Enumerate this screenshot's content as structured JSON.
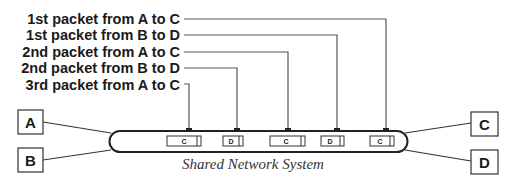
{
  "diagram": {
    "caption": "Shared Network System",
    "labels": [
      {
        "text": "1st packet from A to C",
        "y": 19,
        "x_drop": 386
      },
      {
        "text": "1st packet from B to D",
        "y": 35,
        "x_drop": 337
      },
      {
        "text": "2nd packet from A to C",
        "y": 52,
        "x_drop": 288
      },
      {
        "text": "2nd packet from B to D",
        "y": 68,
        "x_drop": 237
      },
      {
        "text": "3rd packet from A to C",
        "y": 85,
        "x_drop": 189
      }
    ],
    "nodes": {
      "a": "A",
      "b": "B",
      "c": "C",
      "d": "D"
    },
    "packets": [
      {
        "dest": "C",
        "x": 167,
        "w": 34
      },
      {
        "dest": "D",
        "x": 223,
        "w": 20
      },
      {
        "dest": "C",
        "x": 270,
        "w": 35
      },
      {
        "dest": "D",
        "x": 321,
        "w": 23
      },
      {
        "dest": "C",
        "x": 370,
        "w": 24
      }
    ],
    "colors": {
      "line": "#555555",
      "ink": "#1a1a1a"
    }
  }
}
